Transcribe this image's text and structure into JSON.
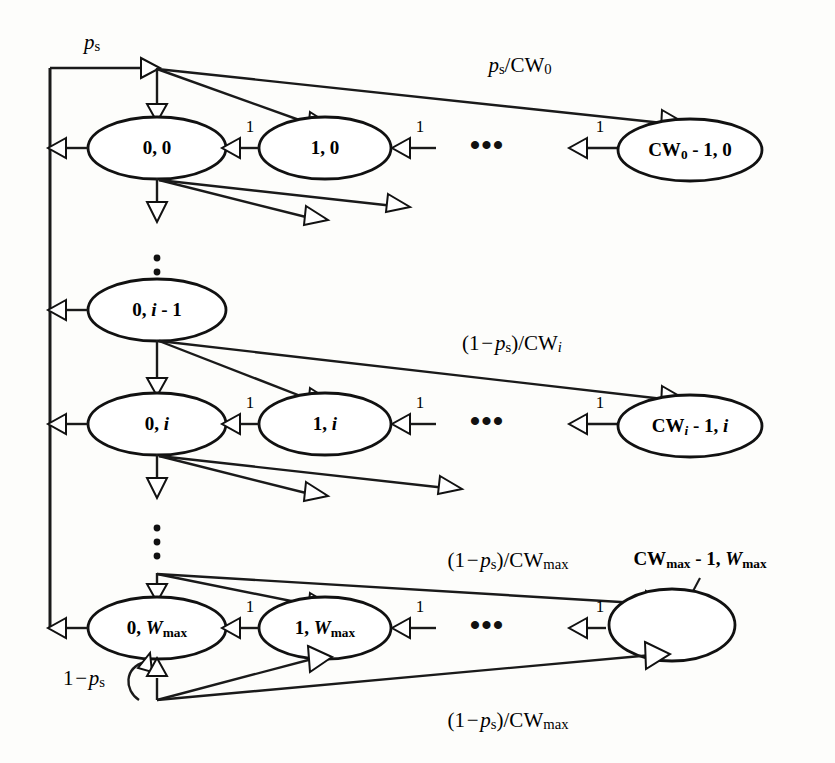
{
  "diagram": {
    "type": "state-transition-diagram",
    "background_color": "#fdfdfb",
    "line_color": "#111111",
    "rows": [
      {
        "id": "row-0",
        "stage_label": "0",
        "nodes": [
          {
            "id": "n-0-0",
            "label": "0, 0",
            "cx": 157,
            "cy": 148
          },
          {
            "id": "n-1-0",
            "label": "1, 0",
            "cx": 325,
            "cy": 148
          },
          {
            "id": "n-cw0-0",
            "label": "CW0 - 1, 0",
            "label_parts": [
              "CW",
              "0",
              " - 1, 0"
            ],
            "cx": 690,
            "cy": 148
          }
        ],
        "ellipsis": {
          "text": "•••",
          "cx": 487,
          "cy": 150
        },
        "branch_label": "ps/CW0",
        "branch_label_x": 520,
        "branch_label_y": 70
      },
      {
        "id": "row-i-minus-1",
        "stage_label": "i - 1",
        "nodes": [
          {
            "id": "n-0-i-1",
            "label": "0, i - 1",
            "cx": 157,
            "cy": 310
          }
        ]
      },
      {
        "id": "row-i",
        "stage_label": "i",
        "nodes": [
          {
            "id": "n-0-i",
            "label": "0, i",
            "cx": 157,
            "cy": 424
          },
          {
            "id": "n-1-i",
            "label": "1, i",
            "cx": 325,
            "cy": 424
          },
          {
            "id": "n-cwi-i",
            "label": "CWi - 1, i",
            "cx": 690,
            "cy": 424
          }
        ],
        "ellipsis": {
          "text": "•••",
          "cx": 487,
          "cy": 426
        },
        "branch_label": "(1 - ps)/CWi",
        "branch_label_x": 510,
        "branch_label_y": 350
      },
      {
        "id": "row-wmax",
        "stage_label": "Wmax",
        "nodes": [
          {
            "id": "n-0-wmax",
            "label": "0, Wmax",
            "cx": 157,
            "cy": 628
          },
          {
            "id": "n-1-wmax",
            "label": "1, Wmax",
            "cx": 325,
            "cy": 628
          },
          {
            "id": "n-cwmax-wmax",
            "label": "",
            "cx": 672,
            "cy": 625
          }
        ],
        "ellipsis": {
          "text": "•••",
          "cx": 487,
          "cy": 630
        },
        "branch_label_top": "(1 - ps)/CWmax",
        "branch_label_bottom": "(1 - ps)/CWmax",
        "external_node_label": "CWmax - 1, Wmax"
      }
    ],
    "labels": {
      "ps": "ps",
      "ps_over_cw0": "ps/CW0",
      "one_minus_ps_over_cwi": "(1 - ps)/CWi",
      "one_minus_ps_over_cwmax_top": "(1 - ps)/CWmax",
      "one_minus_ps_over_cwmax_bottom": "(1 - ps)/CWmax",
      "one_minus_ps": "1 - ps",
      "cwmax_node_external": "CWmax - 1, Wmax",
      "transition_one": "1",
      "horizontal_ellipsis": "•••"
    },
    "node_labels": {
      "n_0_0": "0, 0",
      "n_1_0": "1, 0",
      "n_cw0_1_0": "CW0 - 1, 0",
      "n_0_i_minus_1": "0, i - 1",
      "n_0_i": "0, i",
      "n_1_i": "1, i",
      "n_cwi_1_i": "CWi - 1, i",
      "n_0_wmax": "0, Wmax",
      "n_1_wmax": "1, Wmax",
      "n_cwmax_1_wmax": "CWmax - 1, Wmax"
    },
    "geometry": {
      "spine_x": 50,
      "spine_top_y": 68,
      "spine_bottom_y": 628,
      "hub_top_x": 157,
      "ellipse_rx_left": 69,
      "ellipse_ry_left": 31
    }
  }
}
